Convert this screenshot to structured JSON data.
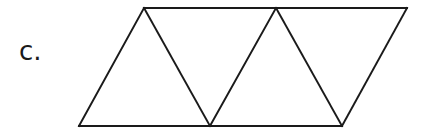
{
  "label": "c.",
  "figure": {
    "stroke_color": "#1a1a1a",
    "stroke_width": 2,
    "vertices": {
      "top": [
        [
          144,
          8
        ],
        [
          276,
          8
        ],
        [
          407,
          8
        ]
      ],
      "bottom": [
        [
          79,
          126
        ],
        [
          210,
          126
        ],
        [
          342,
          126
        ]
      ]
    }
  }
}
